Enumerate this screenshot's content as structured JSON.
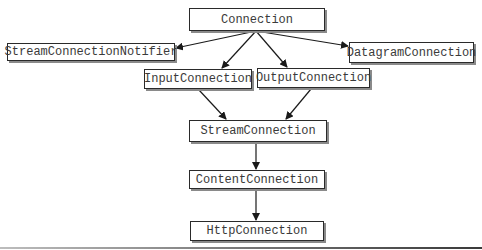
{
  "diagram": {
    "type": "class-hierarchy",
    "nodes": [
      {
        "id": "connection",
        "label": "Connection",
        "x": 189,
        "y": 8,
        "w": 136,
        "h": 23
      },
      {
        "id": "stream_connection_notifier",
        "label": "StreamConnectionNotifier",
        "x": 7,
        "y": 43,
        "w": 168,
        "h": 18
      },
      {
        "id": "datagram_connection",
        "label": "DatagramConnection",
        "x": 349,
        "y": 42,
        "w": 125,
        "h": 21
      },
      {
        "id": "input_connection",
        "label": "InputConnection",
        "x": 144,
        "y": 69,
        "w": 108,
        "h": 20
      },
      {
        "id": "output_connection",
        "label": "OutputConnection",
        "x": 257,
        "y": 68,
        "w": 113,
        "h": 20
      },
      {
        "id": "stream_connection",
        "label": "StreamConnection",
        "x": 189,
        "y": 120,
        "w": 138,
        "h": 22
      },
      {
        "id": "content_connection",
        "label": "ContentConnection",
        "x": 189,
        "y": 170,
        "w": 136,
        "h": 19
      },
      {
        "id": "http_connection",
        "label": "HttpConnection",
        "x": 190,
        "y": 221,
        "w": 134,
        "h": 20
      }
    ],
    "edges": [
      {
        "from": "connection",
        "to": "stream_connection_notifier"
      },
      {
        "from": "connection",
        "to": "input_connection"
      },
      {
        "from": "connection",
        "to": "output_connection"
      },
      {
        "from": "connection",
        "to": "datagram_connection"
      },
      {
        "from": "input_connection",
        "to": "stream_connection"
      },
      {
        "from": "output_connection",
        "to": "stream_connection"
      },
      {
        "from": "stream_connection",
        "to": "content_connection"
      },
      {
        "from": "content_connection",
        "to": "http_connection"
      }
    ]
  },
  "labels": {
    "connection": "Connection",
    "stream_connection_notifier": "StreamConnectionNotifier",
    "datagram_connection": "DatagramConnection",
    "input_connection": "InputConnection",
    "output_connection": "OutputConnection",
    "stream_connection": "StreamConnection",
    "content_connection": "ContentConnection",
    "http_connection": "HttpConnection"
  },
  "colors": {
    "box_border": "#2a2a2a",
    "box_shadow": "#8a8a8a",
    "text": "#3a3a3a",
    "arrow": "#1a1a1a"
  }
}
